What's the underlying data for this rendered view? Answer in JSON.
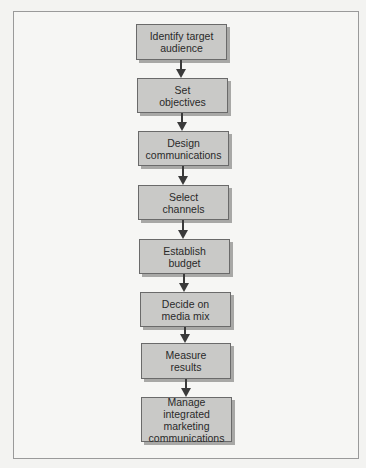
{
  "diagram": {
    "type": "vertical-flowchart",
    "steps": [
      {
        "label": "Identify target\naudience"
      },
      {
        "label": "Set\nobjectives"
      },
      {
        "label": "Design\ncommunications"
      },
      {
        "label": "Select\nchannels"
      },
      {
        "label": "Establish\nbudget"
      },
      {
        "label": "Decide on\nmedia mix"
      },
      {
        "label": "Measure\nresults"
      },
      {
        "label": "Manage integrated\nmarketing\ncommunications"
      }
    ],
    "colors": {
      "node_fill": "#c9c9c7",
      "node_border": "#6a6a6a",
      "node_shadow": "#a8a8a6",
      "arrow": "#3a3a3a",
      "background": "#f6f6f4",
      "frame_border": "#9a9a9a"
    }
  }
}
